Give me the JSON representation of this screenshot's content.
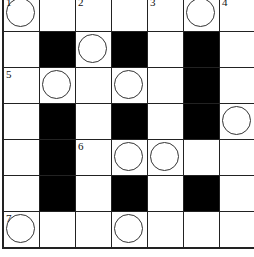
{
  "puzzle": {
    "rows": 7,
    "cols": 7,
    "grid": [
      [
        {
          "n": "1",
          "c": true
        },
        {},
        {
          "n": "2"
        },
        {},
        {
          "n": "3"
        },
        {
          "c": true
        },
        {
          "n": "4"
        }
      ],
      [
        {},
        {
          "b": true
        },
        {
          "c": true
        },
        {
          "b": true
        },
        {},
        {
          "b": true
        },
        {}
      ],
      [
        {
          "n": "5"
        },
        {
          "c": true
        },
        {},
        {
          "c": true
        },
        {},
        {
          "b": true
        },
        {}
      ],
      [
        {},
        {
          "b": true
        },
        {},
        {
          "b": true
        },
        {},
        {
          "b": true
        },
        {
          "c": true
        }
      ],
      [
        {},
        {
          "b": true
        },
        {
          "n": "6"
        },
        {
          "c": true
        },
        {
          "c": true
        },
        {},
        {}
      ],
      [
        {},
        {
          "b": true
        },
        {},
        {
          "b": true
        },
        {},
        {
          "b": true
        },
        {}
      ],
      [
        {
          "n": "7",
          "c": true
        },
        {},
        {},
        {
          "c": true
        },
        {},
        {},
        {}
      ]
    ]
  }
}
